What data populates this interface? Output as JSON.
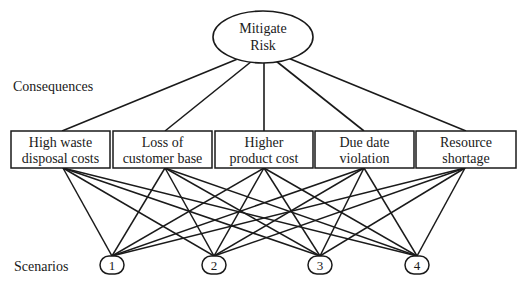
{
  "diagram": {
    "goal": {
      "line1": "Mitigate",
      "line2": "Risk"
    },
    "level_labels": {
      "consequences": "Consequences",
      "scenarios": "Scenarios"
    },
    "consequences": [
      {
        "line1": "High waste",
        "line2": "disposal costs"
      },
      {
        "line1": "Loss of",
        "line2": "customer base"
      },
      {
        "line1": "Higher",
        "line2": "product cost"
      },
      {
        "line1": "Due date",
        "line2": "violation"
      },
      {
        "line1": "Resource",
        "line2": "shortage"
      }
    ],
    "scenarios": [
      {
        "label": "1"
      },
      {
        "label": "2"
      },
      {
        "label": "3"
      },
      {
        "label": "4"
      }
    ],
    "colors": {
      "stroke": "#1a1a1a",
      "background": "#ffffff"
    }
  }
}
